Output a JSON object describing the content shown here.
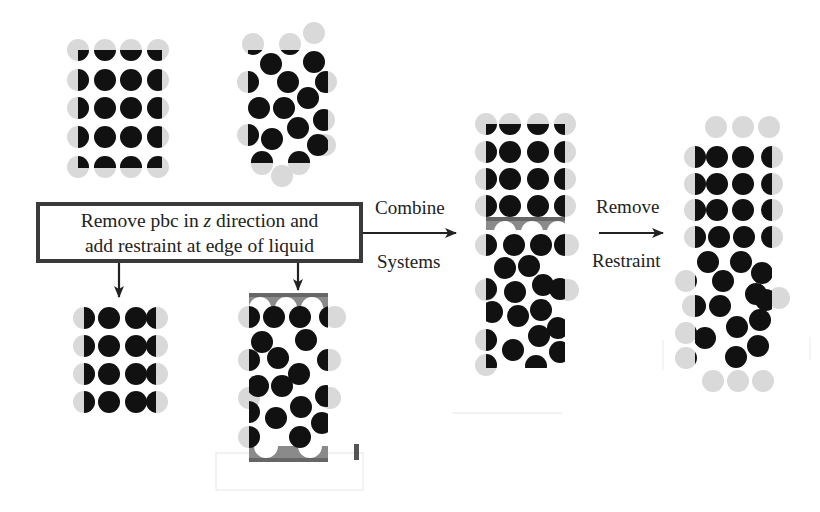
{
  "instruction_box": {
    "line1_before": "Remove pbc in ",
    "line1_italic": "z",
    "line1_after": " direction and",
    "line2": "add restraint at edge of liquid"
  },
  "step_labels": {
    "combine_top": "Combine",
    "combine_bottom": "Systems",
    "remove_top": "Remove",
    "remove_bottom": "Restraint"
  },
  "colors": {
    "particle": "#111111",
    "image_particle": "#d9d9d9",
    "restraint": "#7a7a7a",
    "box_border": "#3a3a3a",
    "arrow": "#222222"
  },
  "panels": [
    {
      "id": "solid-periodic",
      "description": "Solid lattice with periodic images"
    },
    {
      "id": "liquid-periodic",
      "description": "Liquid with periodic images"
    },
    {
      "id": "solid-restrained",
      "description": "Solid with z-pbc removed"
    },
    {
      "id": "liquid-restrained",
      "description": "Liquid with restraint walls"
    },
    {
      "id": "combined",
      "description": "Combined solid-liquid system with restraint"
    },
    {
      "id": "final",
      "description": "Combined system after removing restraint"
    }
  ]
}
